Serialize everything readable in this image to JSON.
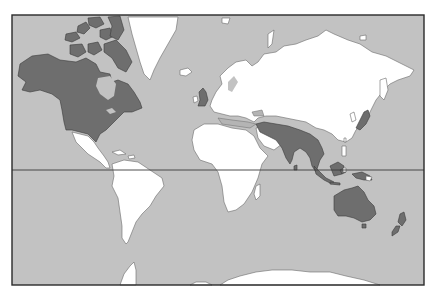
{
  "map": {
    "type": "world-map",
    "projection": "mercator",
    "has_equator_line": true,
    "has_frame": true,
    "labels": [],
    "colors": {
      "ocean": "#c2c2c2",
      "unhighlighted_land": "#ffffff",
      "highlighted_land": "#6e6e6e",
      "frame": "#2a2a2a"
    },
    "highlighted_regions": [
      "Canada",
      "United States",
      "Alaska",
      "United Kingdom",
      "Indian subcontinent",
      "Myanmar / Southeast Asia",
      "Malaysia",
      "Borneo",
      "Japan",
      "Papua / New Guinea",
      "Australia",
      "Tasmania",
      "New Zealand"
    ],
    "unhighlighted_regions": [
      "Greenland",
      "Mexico and Central America",
      "South America",
      "Europe",
      "Africa",
      "Russia / Northern and Central Asia",
      "China",
      "Madagascar",
      "Antarctica"
    ]
  }
}
